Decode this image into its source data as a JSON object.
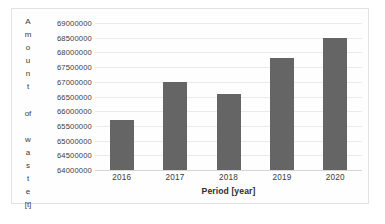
{
  "chart_data": {
    "type": "bar",
    "title": "",
    "categories": [
      "2016",
      "2017",
      "2018",
      "2019",
      "2020"
    ],
    "values": [
      65700000,
      67000000,
      66600000,
      67800000,
      68500000
    ],
    "series": [
      {
        "name": "Amount of waste",
        "values": [
          65700000,
          67000000,
          66600000,
          67800000,
          68500000
        ]
      }
    ],
    "xlabel": "Period [year]",
    "ylabel": "Amount of waste [t]",
    "ylabel_chars": [
      "A",
      "m",
      "o",
      "u",
      "n",
      "t",
      " ",
      "of",
      " ",
      "w",
      "a",
      "s",
      "t",
      "e",
      "[t]"
    ],
    "ylim": [
      64000000,
      69000000
    ],
    "ytick_step": 500000,
    "yticks": [
      "69000000",
      "68500000",
      "68000000",
      "67500000",
      "67000000",
      "66500000",
      "66000000",
      "65500000",
      "65000000",
      "64500000",
      "64000000"
    ],
    "ytick_values": [
      69000000,
      68500000,
      68000000,
      67500000,
      67000000,
      66500000,
      66000000,
      65500000,
      65000000,
      64500000,
      64000000
    ],
    "grid": true,
    "legend": false,
    "legend_position": "none",
    "colors": {
      "bar": "#656565",
      "gridline": "#eaeaea",
      "axis": "#d6d6d6",
      "text": "#3a3a3a",
      "plot_background": "#fefefe",
      "border": "#e2e2e2"
    }
  }
}
